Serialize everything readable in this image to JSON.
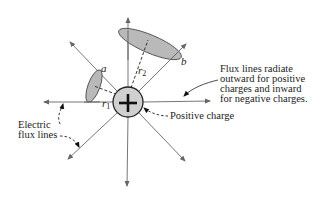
{
  "diagram": {
    "charge": {
      "symbol": "+",
      "label": "Positive charge",
      "fill": "#d0d0d0"
    },
    "surfaces": [
      {
        "name": "a",
        "label": "a",
        "radius_label": "r",
        "radius_sub": "1",
        "fill": "#b9b9b9"
      },
      {
        "name": "b",
        "label": "b",
        "radius_label": "r",
        "radius_sub": "2",
        "fill": "#b9b9b9"
      }
    ],
    "flux_lines_label": [
      "Electric",
      "flux lines"
    ],
    "note": [
      "Flux lines radiate",
      "outward for positive",
      "charges and inward",
      "for negative charges."
    ],
    "flux_line_count": 8,
    "line_color": "#777777"
  }
}
